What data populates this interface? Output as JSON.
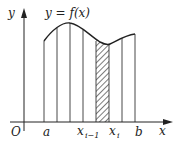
{
  "diagram": {
    "type": "riemann-sum-partition",
    "function_label": "y = f(x)",
    "axes": {
      "x_label": "x",
      "y_label": "y",
      "origin_label": "O"
    },
    "tick_labels": {
      "a": "a",
      "x_prev_main": "x",
      "x_prev_sub": "i−1",
      "x_i_main": "x",
      "x_i_sub": "i",
      "b": "b"
    },
    "shaded_strip": "[x_{i-1}, x_i]",
    "colors": {
      "stroke": "#222222",
      "background": "#ffffff"
    }
  }
}
